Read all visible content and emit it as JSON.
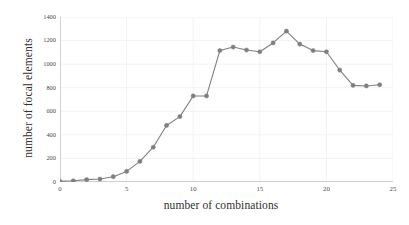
{
  "chart_data": {
    "type": "line",
    "title": "",
    "xlabel": "number of combinations",
    "ylabel": "number of focal elements",
    "xlim": [
      0,
      25
    ],
    "ylim": [
      0,
      1400
    ],
    "xticks": [
      0,
      5,
      10,
      15,
      20,
      25
    ],
    "yticks": [
      0,
      200,
      400,
      600,
      800,
      1000,
      1200,
      1400
    ],
    "grid": true,
    "legend": null,
    "marker": "circle",
    "series_color": "#7f7f7f",
    "x": [
      0,
      1,
      2,
      3,
      4,
      5,
      6,
      7,
      8,
      9,
      10,
      11,
      12,
      13,
      14,
      15,
      16,
      17,
      18,
      19,
      20,
      21,
      22,
      23,
      24
    ],
    "values": [
      5,
      10,
      20,
      25,
      45,
      90,
      175,
      295,
      480,
      555,
      730,
      730,
      1115,
      1145,
      1120,
      1105,
      1180,
      1280,
      1170,
      1115,
      1105,
      950,
      820,
      815,
      825
    ],
    "series": [
      {
        "name": "number of focal elements",
        "values": [
          5,
          10,
          20,
          25,
          45,
          90,
          175,
          295,
          480,
          555,
          730,
          730,
          1115,
          1145,
          1120,
          1105,
          1180,
          1280,
          1170,
          1115,
          1105,
          950,
          820,
          815,
          825
        ]
      }
    ]
  },
  "colors": {
    "series": "#7f7f7f",
    "axis": "#a6a6a6",
    "grid": "#ededed",
    "text": "#3a3a3a",
    "background": "#ffffff"
  }
}
